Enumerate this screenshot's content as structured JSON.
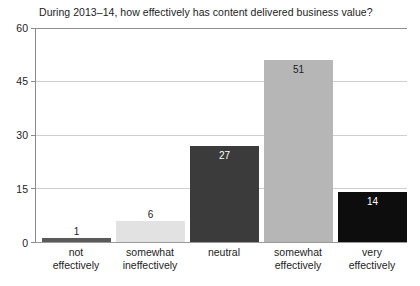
{
  "chart_data": {
    "type": "bar",
    "title": "During 2013–14, how effectively has content delivered business value?",
    "xlabel": "",
    "ylabel": "",
    "ylim": [
      0,
      60
    ],
    "yticks": [
      0,
      15,
      30,
      45,
      60
    ],
    "ytick_labels": [
      "0",
      "15",
      "30",
      "45",
      "60"
    ],
    "grid": true,
    "legend": "none",
    "categories": [
      "not effectively",
      "somewhat ineffectively",
      "neutral",
      "somewhat effectively",
      "very effectively"
    ],
    "category_lines": [
      [
        "not",
        "effectively"
      ],
      [
        "somewhat",
        "ineffectively"
      ],
      [
        "neutral",
        ""
      ],
      [
        "somewhat",
        "effectively"
      ],
      [
        "very",
        "effectively"
      ]
    ],
    "values": [
      1,
      6,
      27,
      51,
      14
    ],
    "value_labels": [
      "1",
      "6",
      "27",
      "51",
      "14"
    ],
    "bar_colors": [
      "#5a5a5a",
      "#e2e2e2",
      "#3b3b3b",
      "#b6b6b6",
      "#0d0d0d"
    ],
    "value_label_colors": [
      "#1c1c1c",
      "#1c1c1c",
      "#ffffff",
      "#1c1c1c",
      "#ffffff"
    ],
    "background_color": "#ffffff",
    "gridline_color": "#cfcfcf",
    "axis_color": "#8b8b8b"
  }
}
